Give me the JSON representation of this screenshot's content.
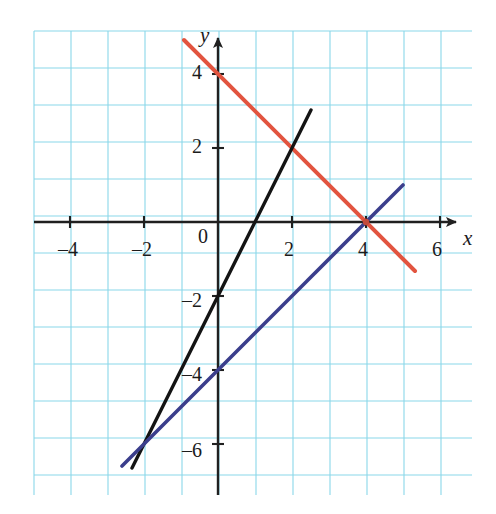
{
  "figure": {
    "kind": "cartesian-line-graph",
    "background_color": "#ffffff",
    "grid": {
      "visible": true,
      "color": "#7fd3e8",
      "cell_px": 37,
      "left_px": 34,
      "top_px": 31,
      "right_px": 472,
      "bottom_px": 495
    },
    "origin_px": {
      "x": 218,
      "y": 222
    },
    "px_per_unit": 37,
    "left_margin_glyph": "."
  },
  "axes": {
    "x": {
      "name": "x",
      "name_px": {
        "x": 463,
        "y": 228
      },
      "arrow": true,
      "line_color": "#202020",
      "start_px": 34,
      "end_px": 462,
      "tick_labels": [
        {
          "value": -4,
          "text": "-4",
          "px": {
            "x": 58,
            "y": 239
          }
        },
        {
          "value": -2,
          "text": "-2",
          "px": {
            "x": 132,
            "y": 239
          }
        },
        {
          "value": 2,
          "text": "2",
          "px": {
            "x": 284,
            "y": 239
          }
        },
        {
          "value": 4,
          "text": "4",
          "px": {
            "x": 358,
            "y": 239
          }
        },
        {
          "value": 6,
          "text": "6",
          "px": {
            "x": 432,
            "y": 239
          }
        }
      ]
    },
    "y": {
      "name": "y",
      "name_px": {
        "x": 200,
        "y": 25
      },
      "arrow": true,
      "line_color": "#202020",
      "start_px": 495,
      "end_px": 32,
      "zero_label": {
        "text": "0",
        "px": {
          "x": 198,
          "y": 226
        }
      },
      "tick_labels": [
        {
          "value": 4,
          "text": "4",
          "px": {
            "x": 192,
            "y": 62
          }
        },
        {
          "value": 2,
          "text": "2",
          "px": {
            "x": 192,
            "y": 136
          }
        },
        {
          "value": -2,
          "text": "-2",
          "px": {
            "x": 182,
            "y": 290
          }
        },
        {
          "value": -4,
          "text": "-4",
          "px": {
            "x": 182,
            "y": 364
          }
        },
        {
          "value": -6,
          "text": "-6",
          "px": {
            "x": 182,
            "y": 440
          }
        }
      ]
    }
  },
  "chart_data": {
    "type": "line",
    "title": "",
    "xlabel": "x",
    "ylabel": "y",
    "xlim": [
      -4.97,
      6.86
    ],
    "ylim": [
      -7.38,
      5.16
    ],
    "grid": true,
    "grid_step": 1,
    "legend": "none",
    "axis_ticks": {
      "x": [
        -4,
        -2,
        0,
        2,
        4,
        6
      ],
      "y": [
        4,
        2,
        0,
        -2,
        -4,
        -6
      ]
    },
    "series": [
      {
        "name": "red-line",
        "color": "#e2543f",
        "equation": "y = -x + 4",
        "slope": -1,
        "intercept": 4,
        "segment": {
          "x": [
            -0.92,
            5.32
          ],
          "y": [
            4.92,
            -1.32
          ]
        },
        "segment_px": {
          "x1": 184,
          "y1": 40,
          "x2": 415,
          "y2": 271
        }
      },
      {
        "name": "black-line",
        "color": "#141414",
        "equation": "y = 2x - 2",
        "slope": 2,
        "intercept": -2,
        "segment": {
          "x": [
            -2.32,
            2.51
          ],
          "y": [
            -6.64,
            3.02
          ]
        },
        "segment_px": {
          "x1": 132,
          "y1": 468,
          "x2": 311,
          "y2": 110
        }
      },
      {
        "name": "blue-line",
        "color": "#3b3e8c",
        "equation": "y = x - 4",
        "slope": 1,
        "intercept": -4,
        "segment": {
          "x": [
            -2.6,
            5.0
          ],
          "y": [
            -6.6,
            1.0
          ]
        },
        "segment_px": {
          "x1": 122,
          "y1": 466,
          "x2": 403,
          "y2": 185
        }
      }
    ],
    "intersections": [
      {
        "lines": [
          "red-line",
          "blue-line"
        ],
        "x": 4,
        "y": 0,
        "px": {
          "x": 366,
          "y": 222
        },
        "marked": true
      },
      {
        "lines": [
          "red-line",
          "black-line"
        ],
        "x": 2,
        "y": 2,
        "px": {
          "x": 292,
          "y": 148
        },
        "marked": false
      },
      {
        "lines": [
          "black-line",
          "blue-line"
        ],
        "x": -2,
        "y": -6,
        "px": {
          "x": 144,
          "y": 444
        },
        "marked": false
      }
    ]
  }
}
